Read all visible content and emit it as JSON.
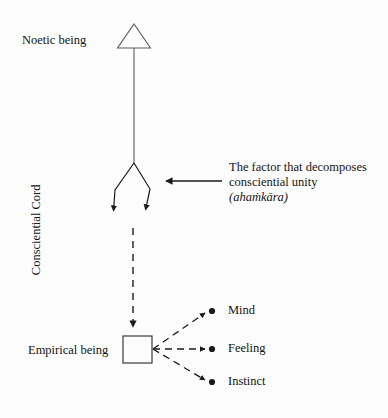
{
  "canvas": {
    "width": 388,
    "height": 418,
    "background": "#fdfdfd",
    "ink": "#1a1a1a"
  },
  "diagram": {
    "nodes": {
      "noetic_being_label": "Noetic being",
      "empirical_being_label": "Empirical being",
      "consciential_cord_label": "Consciential Cord"
    },
    "annotation": {
      "line1": "The factor that decomposes",
      "line2": "consciential unity",
      "line3": "(ahaṁkāra)"
    },
    "outputs": [
      {
        "label": "Mind"
      },
      {
        "label": "Feeling"
      },
      {
        "label": "Instinct"
      }
    ],
    "shapes": {
      "triangle": "open-triangle-arrowhead",
      "square": "open-square",
      "dot": "filled-dot"
    }
  }
}
